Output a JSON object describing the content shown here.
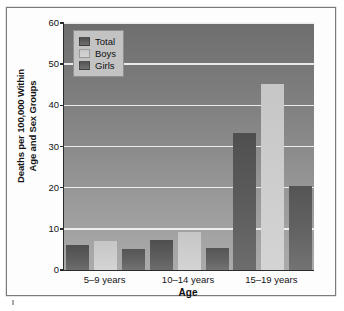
{
  "chart_data": {
    "type": "bar",
    "title": "",
    "xlabel": "Age",
    "ylabel": "Deaths per 100,000 Within Age and Sex Groups",
    "ylabel_lines": [
      "Deaths per 100,000 Within",
      "Age and Sex Groups"
    ],
    "categories": [
      "5–9 years",
      "10–14 years",
      "15–19 years"
    ],
    "series": [
      {
        "name": "Total",
        "color": "#5d5d5d",
        "values": [
          6.0,
          7.3,
          33.2
        ]
      },
      {
        "name": "Boys",
        "color": "#cdcdcd",
        "values": [
          7.0,
          9.2,
          45.2
        ]
      },
      {
        "name": "Girls",
        "color": "#636363",
        "values": [
          5.0,
          5.4,
          20.3
        ]
      }
    ],
    "ylim": [
      0,
      60
    ],
    "yticks": [
      0,
      10,
      20,
      30,
      40,
      50,
      60
    ],
    "ytick_labels": [
      "0",
      "10",
      "20",
      "30",
      "40",
      "50",
      "60"
    ],
    "grid": true,
    "grid_color": "#f4f4f4",
    "legend_position": "top-left",
    "plot_background": "#8a8a8a"
  },
  "legend": {
    "entries": [
      {
        "label": "Total"
      },
      {
        "label": "Boys"
      },
      {
        "label": "Girls"
      }
    ]
  },
  "axis": {
    "x_title": "Age",
    "y_title_line1": "Deaths per 100,000 Within",
    "y_title_line2": "Age and Sex Groups"
  }
}
